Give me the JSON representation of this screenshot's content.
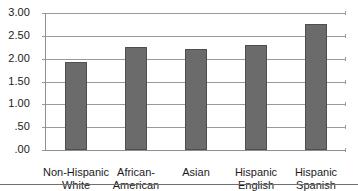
{
  "chart_data": {
    "type": "bar",
    "title": "",
    "subtitle": "",
    "xlabel": "",
    "ylabel": "",
    "categories": [
      "Non-Hispanic\nWhite",
      "African-\nAmerican",
      "Asian",
      "Hispanic\nEnglish",
      "Hispanic\nSpanish"
    ],
    "values": [
      1.92,
      2.25,
      2.21,
      2.3,
      2.75
    ],
    "ylim": [
      0,
      3.0
    ],
    "ytick_values": [
      3.0,
      2.5,
      2.0,
      1.5,
      1.0,
      0.5,
      0.0
    ],
    "ytick_labels": [
      "3.00",
      "2.50",
      "2.00",
      "1.50",
      "1.00",
      ".50",
      ".00"
    ],
    "grid": true,
    "legend": "none",
    "bar_color": "#6b6b6b",
    "bar_edge_color": "#4f4f4f",
    "gridline_color": "#9a9a9a",
    "axis_color": "#8f8f8f",
    "background": "#ffffff"
  }
}
